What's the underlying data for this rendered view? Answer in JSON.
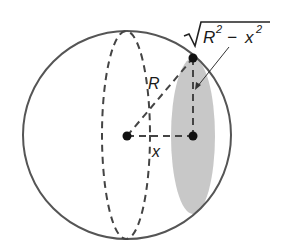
{
  "diagram": {
    "labels": {
      "radius": "R",
      "distance": "x",
      "cross_section_radius_R": "R",
      "cross_section_radius_sup1": "2",
      "cross_section_radius_minus": "−",
      "cross_section_radius_x": "x",
      "cross_section_radius_sup2": "2"
    },
    "colors": {
      "outline": "#555555",
      "dash": "#444444",
      "shade": "#c8c8c8",
      "point": "#111111"
    }
  }
}
